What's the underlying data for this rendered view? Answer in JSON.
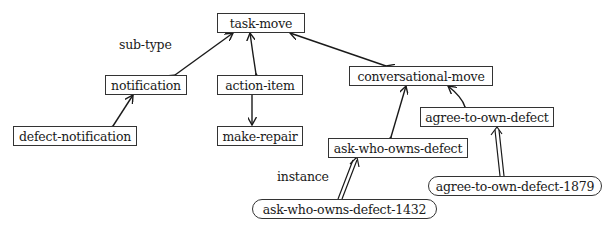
{
  "diagram": {
    "type": "class-hierarchy",
    "labels": {
      "subtype": "sub-type",
      "instance": "instance"
    },
    "nodes": [
      {
        "id": "task-move",
        "label": "task-move",
        "kind": "class"
      },
      {
        "id": "notification",
        "label": "notification",
        "kind": "class"
      },
      {
        "id": "action-item",
        "label": "action-item",
        "kind": "class"
      },
      {
        "id": "conversational-move",
        "label": "conversational-move",
        "kind": "class"
      },
      {
        "id": "defect-notification",
        "label": "defect-notification",
        "kind": "class"
      },
      {
        "id": "make-repair",
        "label": "make-repair",
        "kind": "class"
      },
      {
        "id": "agree-to-own-defect",
        "label": "agree-to-own-defect",
        "kind": "class"
      },
      {
        "id": "ask-who-owns-defect",
        "label": "ask-who-owns-defect",
        "kind": "class"
      },
      {
        "id": "agree-to-own-defect-1879",
        "label": "agree-to-own-defect-1879",
        "kind": "instance"
      },
      {
        "id": "ask-who-owns-defect-1432",
        "label": "ask-who-owns-defect-1432",
        "kind": "instance"
      }
    ],
    "edges": [
      {
        "from": "notification",
        "to": "task-move",
        "relation": "sub-type"
      },
      {
        "from": "action-item",
        "to": "task-move",
        "relation": "sub-type"
      },
      {
        "from": "conversational-move",
        "to": "task-move",
        "relation": "sub-type"
      },
      {
        "from": "defect-notification",
        "to": "notification",
        "relation": "sub-type"
      },
      {
        "from": "make-repair",
        "to": "action-item",
        "relation": "sub-type"
      },
      {
        "from": "agree-to-own-defect",
        "to": "conversational-move",
        "relation": "sub-type"
      },
      {
        "from": "ask-who-owns-defect",
        "to": "conversational-move",
        "relation": "sub-type"
      },
      {
        "from": "agree-to-own-defect-1879",
        "to": "agree-to-own-defect",
        "relation": "instance"
      },
      {
        "from": "ask-who-owns-defect-1432",
        "to": "ask-who-owns-defect",
        "relation": "instance"
      }
    ]
  }
}
